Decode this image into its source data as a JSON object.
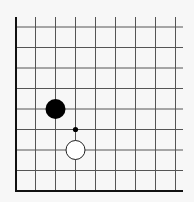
{
  "diagram": {
    "type": "go-board-fragment",
    "colors": {
      "background": "#f7f7f7",
      "grid": "#555555",
      "edge": "#111111",
      "black_stone": "#000000",
      "white_stone_fill": "#ffffff",
      "white_stone_stroke": "#222222",
      "marker": "#000000"
    },
    "grid": {
      "columns_visible": 9,
      "rows_visible": 9,
      "left_edge": true,
      "bottom_edge": true
    },
    "stones": [
      {
        "color": "black",
        "col": 2,
        "row": 4,
        "label": "black-stone"
      },
      {
        "color": "white",
        "col": 3,
        "row": 6,
        "label": "white-stone"
      }
    ],
    "markers": [
      {
        "type": "small-dot",
        "col": 3,
        "row": 5,
        "label": "move-marker"
      }
    ]
  }
}
